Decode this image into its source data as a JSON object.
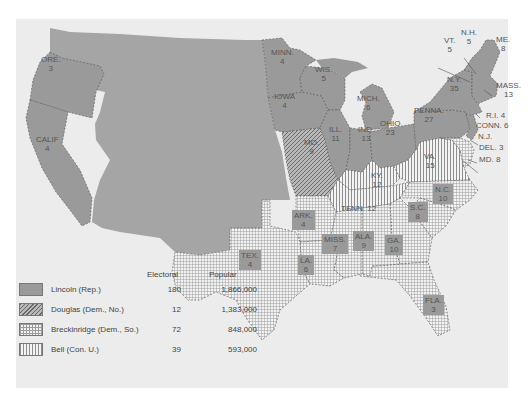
{
  "map": {
    "title": "Election of 1860",
    "colors": {
      "lincoln": "#9a9a9a",
      "territory": "#a5a5a5",
      "background": "#ececec",
      "water": "#ececec"
    },
    "states": [
      {
        "abbr": "ORE.",
        "ev": "3",
        "party": "Lincoln"
      },
      {
        "abbr": "CALIF",
        "ev": "4",
        "party": "Lincoln"
      },
      {
        "abbr": "MINN.",
        "ev": "4",
        "party": "Lincoln"
      },
      {
        "abbr": "WIS.",
        "ev": "5",
        "party": "Lincoln"
      },
      {
        "abbr": "IOWA",
        "ev": "4",
        "party": "Lincoln"
      },
      {
        "abbr": "MICH.",
        "ev": "6",
        "party": "Lincoln"
      },
      {
        "abbr": "ILL.",
        "ev": "11",
        "party": "Lincoln"
      },
      {
        "abbr": "IND.",
        "ev": "13",
        "party": "Lincoln"
      },
      {
        "abbr": "OHIO",
        "ev": "23",
        "party": "Lincoln"
      },
      {
        "abbr": "PENNA.",
        "ev": "27",
        "party": "Lincoln"
      },
      {
        "abbr": "N.Y.",
        "ev": "35",
        "party": "Lincoln"
      },
      {
        "abbr": "VT.",
        "ev": "5",
        "party": "Lincoln"
      },
      {
        "abbr": "N.H.",
        "ev": "5",
        "party": "Lincoln"
      },
      {
        "abbr": "ME.",
        "ev": "8",
        "party": "Lincoln"
      },
      {
        "abbr": "MASS.",
        "ev": "13",
        "party": "Lincoln"
      },
      {
        "abbr": "R.I.",
        "ev": "4",
        "party": "Lincoln"
      },
      {
        "abbr": "CONN.",
        "ev": "6",
        "party": "Lincoln"
      },
      {
        "abbr": "N.J.",
        "ev": "",
        "party": "Lincoln/Douglas"
      },
      {
        "abbr": "DEL.",
        "ev": "3",
        "party": "Breckinridge"
      },
      {
        "abbr": "MD.",
        "ev": "8",
        "party": "Breckinridge"
      },
      {
        "abbr": "MO.",
        "ev": "9",
        "party": "Douglas"
      },
      {
        "abbr": "KY.",
        "ev": "12",
        "party": "Bell"
      },
      {
        "abbr": "VA.",
        "ev": "15",
        "party": "Bell"
      },
      {
        "abbr": "TENN.",
        "ev": "12",
        "party": "Bell"
      },
      {
        "abbr": "N.C.",
        "ev": "10",
        "party": "Breckinridge"
      },
      {
        "abbr": "S.C.",
        "ev": "8",
        "party": "Breckinridge"
      },
      {
        "abbr": "ARK.",
        "ev": "4",
        "party": "Breckinridge"
      },
      {
        "abbr": "MISS.",
        "ev": "7",
        "party": "Breckinridge"
      },
      {
        "abbr": "ALA.",
        "ev": "9",
        "party": "Breckinridge"
      },
      {
        "abbr": "GA.",
        "ev": "10",
        "party": "Breckinridge"
      },
      {
        "abbr": "LA.",
        "ev": "6",
        "party": "Breckinridge"
      },
      {
        "abbr": "TEX.",
        "ev": "4",
        "party": "Breckinridge"
      },
      {
        "abbr": "FLA.",
        "ev": "3",
        "party": "Breckinridge"
      }
    ],
    "labels": {
      "ore": "ORE.\n3",
      "calif": "CALIF\n4",
      "minn": "MINN.\n4",
      "wis": "WIS.\n5",
      "iowa": "IOWA\n4",
      "mich": "MICH.\n6",
      "ill": "ILL.\n11",
      "ind": "IND.\n13",
      "ohio": "OHIO\n23",
      "penna": "PENNA.\n27",
      "ny": "N.Y.\n35",
      "vt": "VT.\n5",
      "nh": "N.H.\n5",
      "me": "ME.\n8",
      "mass": "MASS.\n13",
      "ri": "R.I. 4",
      "conn": "CONN. 6",
      "nj": "N.J.",
      "del": "DEL. 3",
      "md": "MD. 8",
      "mo": "MO.\n9",
      "ky": "KY.\n12",
      "va": "VA.\n15",
      "tenn": "TENN. 12",
      "nc": "N.C.\n10",
      "sc": "S.C.\n8",
      "ark": "ARK.\n4",
      "miss": "MISS.\n7",
      "ala": "ALA.\n9",
      "ga": "GA.\n10",
      "la": "LA.\n6",
      "tex": "TEX.\n4",
      "fla": "FLA.\n3"
    }
  },
  "legend": {
    "headers": {
      "electoral": "Electoral",
      "popular": "Popular"
    },
    "items": [
      {
        "name": "Lincoln (Rep.)",
        "electoral": "180",
        "popular": "1,866,000",
        "pattern": "solid"
      },
      {
        "name": "Douglas (Dem., No.)",
        "electoral": "12",
        "popular": "1,383,000",
        "pattern": "diagonal"
      },
      {
        "name": "Breckinridge (Dem., So.)",
        "electoral": "72",
        "popular": "848,000",
        "pattern": "grid"
      },
      {
        "name": "Bell (Con. U.)",
        "electoral": "39",
        "popular": "593,000",
        "pattern": "vertical"
      }
    ]
  }
}
